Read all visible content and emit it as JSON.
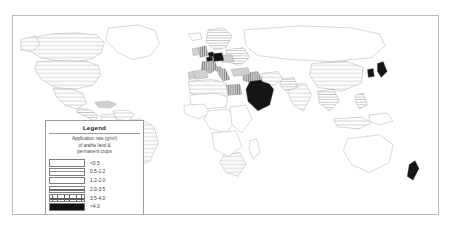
{
  "figure": {
    "kind": "choropleth-world-map",
    "title": ""
  },
  "legend": {
    "title": "Legend",
    "subtitle": "Application rate (g/m²) of arable land & permanent crops",
    "subtitle_lines": [
      "Application rate (g/m²)",
      "of arable land &",
      "permanent crops"
    ],
    "classes": [
      {
        "label": "<0.5",
        "pattern": "blank",
        "swatch_class": "sw-0"
      },
      {
        "label": "0.5-1.2",
        "pattern": "sparse-lines",
        "swatch_class": "sw-1"
      },
      {
        "label": "1.2-2.0",
        "pattern": "medium-lines",
        "swatch_class": "sw-2"
      },
      {
        "label": "2.0-3.5",
        "pattern": "dense-lines",
        "swatch_class": "sw-3"
      },
      {
        "label": "3.5-4.0",
        "pattern": "cross-hatch",
        "swatch_class": "sw-4"
      },
      {
        "label": ">4.0",
        "pattern": "solid-black",
        "swatch_class": "sw-5"
      }
    ]
  },
  "map": {
    "regions": [
      {
        "name": "canada",
        "class_index": 1
      },
      {
        "name": "united-states",
        "class_index": 1
      },
      {
        "name": "mexico",
        "class_index": 1
      },
      {
        "name": "central-america",
        "class_index": 2
      },
      {
        "name": "caribbean",
        "class_index": 3
      },
      {
        "name": "colombia",
        "class_index": 1
      },
      {
        "name": "venezuela",
        "class_index": 1
      },
      {
        "name": "brazil",
        "class_index": 1
      },
      {
        "name": "peru",
        "class_index": 0
      },
      {
        "name": "bolivia",
        "class_index": 0
      },
      {
        "name": "argentina",
        "class_index": 0
      },
      {
        "name": "chile",
        "class_index": 0
      },
      {
        "name": "greenland",
        "class_index": 0
      },
      {
        "name": "iceland",
        "class_index": 0
      },
      {
        "name": "united-kingdom",
        "class_index": 4
      },
      {
        "name": "ireland",
        "class_index": 3
      },
      {
        "name": "france",
        "class_index": 4
      },
      {
        "name": "spain",
        "class_index": 3
      },
      {
        "name": "portugal",
        "class_index": 3
      },
      {
        "name": "germany",
        "class_index": 5
      },
      {
        "name": "netherlands",
        "class_index": 5
      },
      {
        "name": "belgium",
        "class_index": 5
      },
      {
        "name": "switzerland",
        "class_index": 4
      },
      {
        "name": "italy",
        "class_index": 4
      },
      {
        "name": "poland",
        "class_index": 3
      },
      {
        "name": "scandinavia",
        "class_index": 2
      },
      {
        "name": "eastern-europe",
        "class_index": 2
      },
      {
        "name": "russia",
        "class_index": 0
      },
      {
        "name": "turkey",
        "class_index": 3
      },
      {
        "name": "egypt",
        "class_index": 4
      },
      {
        "name": "north-africa",
        "class_index": 1
      },
      {
        "name": "sahel",
        "class_index": 0
      },
      {
        "name": "west-africa",
        "class_index": 0
      },
      {
        "name": "central-africa",
        "class_index": 0
      },
      {
        "name": "east-africa",
        "class_index": 0
      },
      {
        "name": "southern-africa",
        "class_index": 1
      },
      {
        "name": "madagascar",
        "class_index": 0
      },
      {
        "name": "saudi-arabia",
        "class_index": 5
      },
      {
        "name": "middle-east",
        "class_index": 4
      },
      {
        "name": "iran",
        "class_index": 1
      },
      {
        "name": "india",
        "class_index": 1
      },
      {
        "name": "pakistan",
        "class_index": 2
      },
      {
        "name": "china",
        "class_index": 1
      },
      {
        "name": "mongolia",
        "class_index": 0
      },
      {
        "name": "japan",
        "class_index": 5
      },
      {
        "name": "korea",
        "class_index": 5
      },
      {
        "name": "southeast-asia",
        "class_index": 2
      },
      {
        "name": "indonesia",
        "class_index": 1
      },
      {
        "name": "philippines",
        "class_index": 2
      },
      {
        "name": "australia",
        "class_index": 0
      },
      {
        "name": "new-zealand",
        "class_index": 5
      }
    ]
  }
}
